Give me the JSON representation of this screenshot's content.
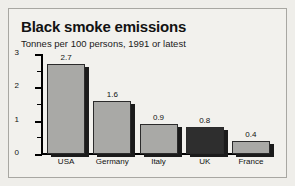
{
  "chart_data": {
    "type": "bar",
    "title": "Black smoke emissions",
    "subtitle": "Tonnes per 100 persons, 1991 or latest",
    "xlabel": "",
    "ylabel": "",
    "ylim": [
      0,
      3
    ],
    "yticks": [
      "0",
      "1",
      "2",
      "3"
    ],
    "ytick_values": [
      0,
      1,
      2,
      3
    ],
    "minor_tick_values": [
      0.5,
      1.5,
      2.5
    ],
    "grid": false,
    "legend": false,
    "categories": [
      "USA",
      "Germany",
      "Italy",
      "UK",
      "France"
    ],
    "values": [
      2.7,
      1.6,
      0.9,
      0.8,
      0.4
    ],
    "value_labels": [
      "2.7",
      "1.6",
      "0.9",
      "0.8",
      "0.4"
    ],
    "highlight_category": "UK",
    "colors": {
      "bar_fill": "#a9a9a6",
      "bar_fill_highlight": "#2e2e2e",
      "bar_border": "#2b2b2b",
      "bar_shadow": "#1b1b1b",
      "axis": "#000000",
      "text": "#111111",
      "panel_background": "#f2f1ed",
      "page_background": "#efeeea",
      "panel_border": "#a8a7a2"
    }
  }
}
